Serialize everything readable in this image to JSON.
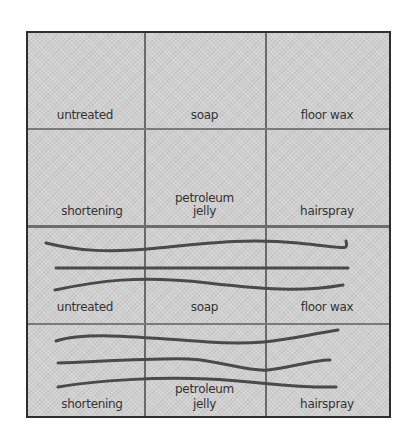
{
  "figure": {
    "rows": [
      {
        "section": "before",
        "cells": [
          {
            "label": "untreated",
            "has_strands": false
          },
          {
            "label": "soap",
            "has_strands": false
          },
          {
            "label": "floor wax",
            "has_strands": false
          }
        ]
      },
      {
        "section": "before",
        "cells": [
          {
            "label": "shortening",
            "has_strands": false
          },
          {
            "label_line1": "petroleum",
            "label_line2": "jelly",
            "has_strands": false
          },
          {
            "label": "hairspray",
            "has_strands": false
          }
        ]
      },
      {
        "section": "after",
        "cells": [
          {
            "label": "untreated",
            "has_strands": true
          },
          {
            "label": "soap",
            "has_strands": true
          },
          {
            "label": "floor wax",
            "has_strands": true
          }
        ]
      },
      {
        "section": "after",
        "cells": [
          {
            "label": "shortening",
            "has_strands": true
          },
          {
            "label_line1": "petroleum",
            "label_line2": "jelly",
            "has_strands": true
          },
          {
            "label": "hairspray",
            "has_strands": true
          }
        ]
      }
    ],
    "colors": {
      "background": "#cfcfcf",
      "border": "#2e2e2e",
      "strand": "#4a4a4a",
      "text": "#333333"
    }
  }
}
